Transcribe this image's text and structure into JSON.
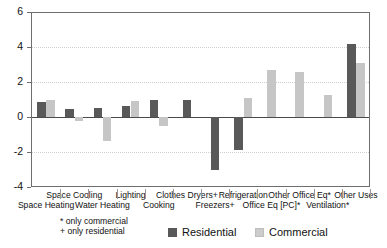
{
  "chart_data": {
    "type": "bar",
    "title": "",
    "subtitle": "",
    "xlabel": "",
    "ylabel": "",
    "ylim": [
      -4,
      6
    ],
    "yticks": [
      6,
      4,
      2,
      0,
      -2,
      -4
    ],
    "grid": true,
    "legend_position": "bottom",
    "categories": [
      "Space Heating",
      "Space Cooling",
      "Water Heating",
      "Lighting",
      "Cooking",
      "Clothes Dryers+",
      "Freezers+",
      "Refrigeration",
      "Office Eq [PC]*",
      "Other Office Eq*",
      "Ventilation*",
      "Other Uses"
    ],
    "series": [
      {
        "name": "Residential",
        "color": "#595959",
        "values": [
          0.85,
          0.45,
          0.5,
          0.65,
          0.95,
          0.95,
          -3.05,
          -1.9,
          null,
          null,
          null,
          4.2
        ]
      },
      {
        "name": "Commercial",
        "color": "#c6c6c6",
        "values": [
          1.0,
          -0.2,
          -1.35,
          0.9,
          -0.5,
          null,
          null,
          1.1,
          2.7,
          2.6,
          1.25,
          3.1
        ]
      }
    ]
  },
  "axis": {
    "y_tick_labels": [
      "6",
      "4",
      "2",
      "0",
      "-2",
      "-4"
    ]
  },
  "category_labels": {
    "row1": [
      "Space Cooling",
      "Lighting",
      "Clothes Dryers+",
      "Refrigeration",
      "Other Office Eq*",
      "Other Uses"
    ],
    "row2": [
      "Space Heating",
      "Water Heating",
      "Cooking",
      "Freezers+",
      "Office Eq [PC]*",
      "Ventilation*"
    ]
  },
  "footnotes": {
    "line1": "* only commercial",
    "line2": "+ only residential"
  },
  "legend": {
    "residential_label": "Residential",
    "commercial_label": "Commercial"
  },
  "colors": {
    "residential": "#595959",
    "commercial": "#c6c6c6",
    "axis": "#6e6e6e",
    "gridline": "#cfcfcf",
    "zeroline": "#4a4a4a",
    "background": "#ffffff"
  }
}
